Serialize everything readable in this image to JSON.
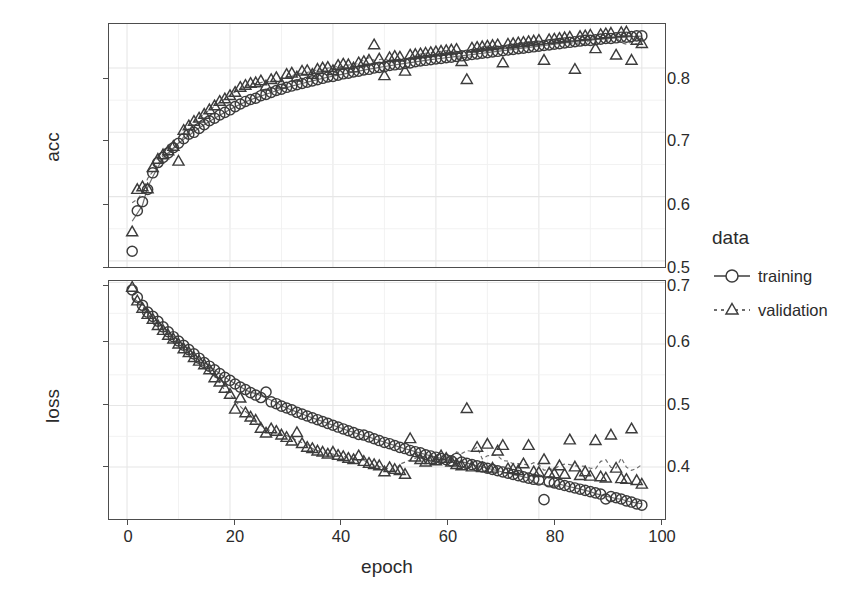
{
  "chart_data": {
    "type": "scatter",
    "title": "",
    "xlabel": "epoch",
    "facets": [
      {
        "name": "acc",
        "ylabel": "acc",
        "ylim": [
          0.4905,
          0.8685
        ],
        "yticks": [
          0.5,
          0.6,
          0.7,
          0.8
        ],
        "ytick_labels": [
          "0.5",
          "0.6",
          "0.7",
          "0.8"
        ]
      },
      {
        "name": "loss",
        "ylabel": "loss",
        "ylim": [
          0.3155,
          0.7025
        ],
        "yticks": [
          0.4,
          0.5,
          0.6,
          0.7
        ],
        "ytick_labels": [
          "0.4",
          "0.5",
          "0.6",
          "0.7"
        ]
      }
    ],
    "xlim": [
      -3.5,
      104.5
    ],
    "xticks": [
      0,
      20,
      40,
      60,
      80,
      100
    ],
    "xtick_labels": [
      "0",
      "20",
      "40",
      "60",
      "80",
      "100"
    ],
    "grid": true,
    "legend": {
      "title": "data",
      "position": "right",
      "entries": [
        {
          "label": "training",
          "marker": "circle",
          "line": "solid",
          "color": "#3c3c3c"
        },
        {
          "label": "validation",
          "marker": "triangle",
          "line": "dashed",
          "color": "#3c3c3c"
        }
      ]
    },
    "x": [
      1,
      2,
      3,
      4,
      5,
      6,
      7,
      8,
      9,
      10,
      11,
      12,
      13,
      14,
      15,
      16,
      17,
      18,
      19,
      20,
      21,
      22,
      23,
      24,
      25,
      26,
      27,
      28,
      29,
      30,
      31,
      32,
      33,
      34,
      35,
      36,
      37,
      38,
      39,
      40,
      41,
      42,
      43,
      44,
      45,
      46,
      47,
      48,
      49,
      50,
      51,
      52,
      53,
      54,
      55,
      56,
      57,
      58,
      59,
      60,
      61,
      62,
      63,
      64,
      65,
      66,
      67,
      68,
      69,
      70,
      71,
      72,
      73,
      74,
      75,
      76,
      77,
      78,
      79,
      80,
      81,
      82,
      83,
      84,
      85,
      86,
      87,
      88,
      89,
      90,
      91,
      92,
      93,
      94,
      95,
      96,
      97,
      98,
      99,
      100
    ],
    "series": [
      {
        "name": "training",
        "facet": "acc",
        "marker": "circle",
        "line": "solid",
        "values": [
          0.515,
          0.578,
          0.592,
          0.611,
          0.637,
          0.653,
          0.661,
          0.668,
          0.676,
          0.683,
          0.69,
          0.697,
          0.7,
          0.706,
          0.712,
          0.718,
          0.722,
          0.727,
          0.731,
          0.735,
          0.74,
          0.744,
          0.748,
          0.751,
          0.753,
          0.757,
          0.759,
          0.762,
          0.765,
          0.767,
          0.77,
          0.772,
          0.774,
          0.776,
          0.778,
          0.78,
          0.782,
          0.784,
          0.786,
          0.787,
          0.789,
          0.791,
          0.792,
          0.794,
          0.795,
          0.797,
          0.798,
          0.8,
          0.801,
          0.802,
          0.804,
          0.805,
          0.806,
          0.807,
          0.808,
          0.81,
          0.811,
          0.812,
          0.813,
          0.814,
          0.815,
          0.816,
          0.817,
          0.818,
          0.819,
          0.82,
          0.821,
          0.822,
          0.823,
          0.824,
          0.825,
          0.826,
          0.827,
          0.828,
          0.829,
          0.83,
          0.831,
          0.832,
          0.833,
          0.834,
          0.835,
          0.836,
          0.837,
          0.838,
          0.839,
          0.84,
          0.841,
          0.842,
          0.843,
          0.843,
          0.844,
          0.845,
          0.846,
          0.846,
          0.847,
          0.848,
          0.848,
          0.849,
          0.85,
          0.85
        ]
      },
      {
        "name": "validation",
        "facet": "acc",
        "marker": "triangle",
        "line": "dashed",
        "values": [
          0.545,
          0.611,
          0.615,
          0.612,
          0.645,
          0.658,
          0.665,
          0.671,
          0.678,
          0.655,
          0.703,
          0.71,
          0.717,
          0.722,
          0.728,
          0.735,
          0.741,
          0.748,
          0.752,
          0.757,
          0.762,
          0.77,
          0.773,
          0.776,
          0.777,
          0.78,
          0.772,
          0.782,
          0.785,
          0.775,
          0.79,
          0.792,
          0.786,
          0.795,
          0.796,
          0.79,
          0.798,
          0.8,
          0.801,
          0.796,
          0.804,
          0.806,
          0.805,
          0.8,
          0.808,
          0.81,
          0.812,
          0.836,
          0.814,
          0.788,
          0.816,
          0.818,
          0.817,
          0.795,
          0.82,
          0.821,
          0.822,
          0.823,
          0.824,
          0.825,
          0.826,
          0.827,
          0.828,
          0.829,
          0.81,
          0.782,
          0.831,
          0.832,
          0.833,
          0.834,
          0.835,
          0.836,
          0.808,
          0.837,
          0.838,
          0.839,
          0.84,
          0.841,
          0.842,
          0.843,
          0.812,
          0.844,
          0.845,
          0.846,
          0.847,
          0.848,
          0.798,
          0.849,
          0.85,
          0.851,
          0.83,
          0.852,
          0.853,
          0.854,
          0.82,
          0.855,
          0.856,
          0.812,
          0.843,
          0.838
        ]
      },
      {
        "name": "training",
        "facet": "loss",
        "marker": "circle",
        "line": "solid",
        "values": [
          0.688,
          0.676,
          0.663,
          0.652,
          0.645,
          0.637,
          0.628,
          0.62,
          0.612,
          0.605,
          0.598,
          0.591,
          0.584,
          0.577,
          0.57,
          0.564,
          0.558,
          0.552,
          0.546,
          0.541,
          0.535,
          0.53,
          0.526,
          0.521,
          0.517,
          0.513,
          0.522,
          0.506,
          0.503,
          0.499,
          0.496,
          0.493,
          0.489,
          0.486,
          0.483,
          0.48,
          0.477,
          0.474,
          0.471,
          0.468,
          0.465,
          0.462,
          0.459,
          0.456,
          0.453,
          0.452,
          0.449,
          0.446,
          0.443,
          0.44,
          0.438,
          0.435,
          0.432,
          0.43,
          0.427,
          0.425,
          0.423,
          0.42,
          0.418,
          0.416,
          0.414,
          0.412,
          0.41,
          0.414,
          0.408,
          0.406,
          0.404,
          0.402,
          0.4,
          0.398,
          0.396,
          0.394,
          0.392,
          0.39,
          0.388,
          0.386,
          0.384,
          0.382,
          0.38,
          0.379,
          0.347,
          0.376,
          0.374,
          0.372,
          0.37,
          0.368,
          0.366,
          0.364,
          0.362,
          0.36,
          0.358,
          0.356,
          0.348,
          0.352,
          0.35,
          0.348,
          0.345,
          0.343,
          0.34,
          0.338
        ]
      },
      {
        "name": "validation",
        "facet": "loss",
        "marker": "triangle",
        "line": "dashed",
        "values": [
          0.692,
          0.67,
          0.658,
          0.648,
          0.64,
          0.63,
          0.622,
          0.614,
          0.608,
          0.6,
          0.592,
          0.586,
          0.578,
          0.572,
          0.566,
          0.558,
          0.545,
          0.538,
          0.528,
          0.518,
          0.494,
          0.512,
          0.488,
          0.481,
          0.476,
          0.463,
          0.455,
          0.462,
          0.458,
          0.452,
          0.448,
          0.442,
          0.456,
          0.438,
          0.432,
          0.43,
          0.426,
          0.424,
          0.421,
          0.424,
          0.419,
          0.417,
          0.414,
          0.412,
          0.418,
          0.409,
          0.406,
          0.404,
          0.402,
          0.392,
          0.399,
          0.396,
          0.394,
          0.388,
          0.446,
          0.416,
          0.412,
          0.408,
          0.412,
          0.41,
          0.418,
          0.414,
          0.408,
          0.404,
          0.402,
          0.495,
          0.4,
          0.432,
          0.399,
          0.437,
          0.398,
          0.426,
          0.435,
          0.397,
          0.396,
          0.394,
          0.405,
          0.435,
          0.392,
          0.391,
          0.412,
          0.39,
          0.389,
          0.402,
          0.388,
          0.444,
          0.4,
          0.386,
          0.392,
          0.385,
          0.443,
          0.384,
          0.382,
          0.452,
          0.398,
          0.381,
          0.38,
          0.462,
          0.378,
          0.372
        ]
      }
    ]
  },
  "axes": {
    "acc": {
      "ylabel": "acc",
      "ytick_labels": [
        "0.8",
        "0.7",
        "0.6",
        "0.5"
      ]
    },
    "loss": {
      "ylabel": "loss",
      "ytick_labels": [
        "0.7",
        "0.6",
        "0.5",
        "0.4"
      ]
    },
    "x": {
      "label": "epoch",
      "tick_labels": [
        "0",
        "20",
        "40",
        "60",
        "80",
        "100"
      ]
    }
  },
  "legend": {
    "title": "data",
    "items": [
      {
        "label": "training"
      },
      {
        "label": "validation"
      }
    ]
  }
}
